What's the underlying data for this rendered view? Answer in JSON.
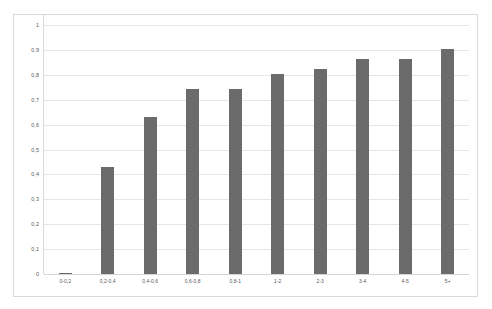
{
  "chart_data": {
    "type": "bar",
    "title": "",
    "subtitle": "",
    "xlabel": "",
    "ylabel": "",
    "categories": [
      "0-0,2",
      "0,2-0,4",
      "0,4-0,6",
      "0,6-0,8",
      "0,8-1",
      "1-2",
      "2-3",
      "3-4",
      "4-5",
      "5+"
    ],
    "values": [
      0.005,
      0.43,
      0.632,
      0.745,
      0.745,
      0.805,
      0.825,
      0.862,
      0.862,
      0.905
    ],
    "series": [
      {
        "name": "",
        "values": [
          0.005,
          0.43,
          0.632,
          0.745,
          0.745,
          0.805,
          0.825,
          0.862,
          0.862,
          0.905
        ]
      }
    ],
    "ylim": [
      0,
      1
    ],
    "ytick_values": [
      0,
      0.1,
      0.2,
      0.3,
      0.4,
      0.5,
      0.6,
      0.7,
      0.8,
      0.9,
      1
    ],
    "ytick_labels": [
      "0",
      "0,1",
      "0,2",
      "0,3",
      "0,4",
      "0,5",
      "0,6",
      "0,7",
      "0,8",
      "0,9",
      "1"
    ],
    "grid": "horizontal",
    "legend": "none",
    "bar_color": "#6b6b6b",
    "grid_color": "#e6e6e6",
    "border_color": "#d9d9d9",
    "background_color": "#ffffff",
    "annotations": []
  }
}
